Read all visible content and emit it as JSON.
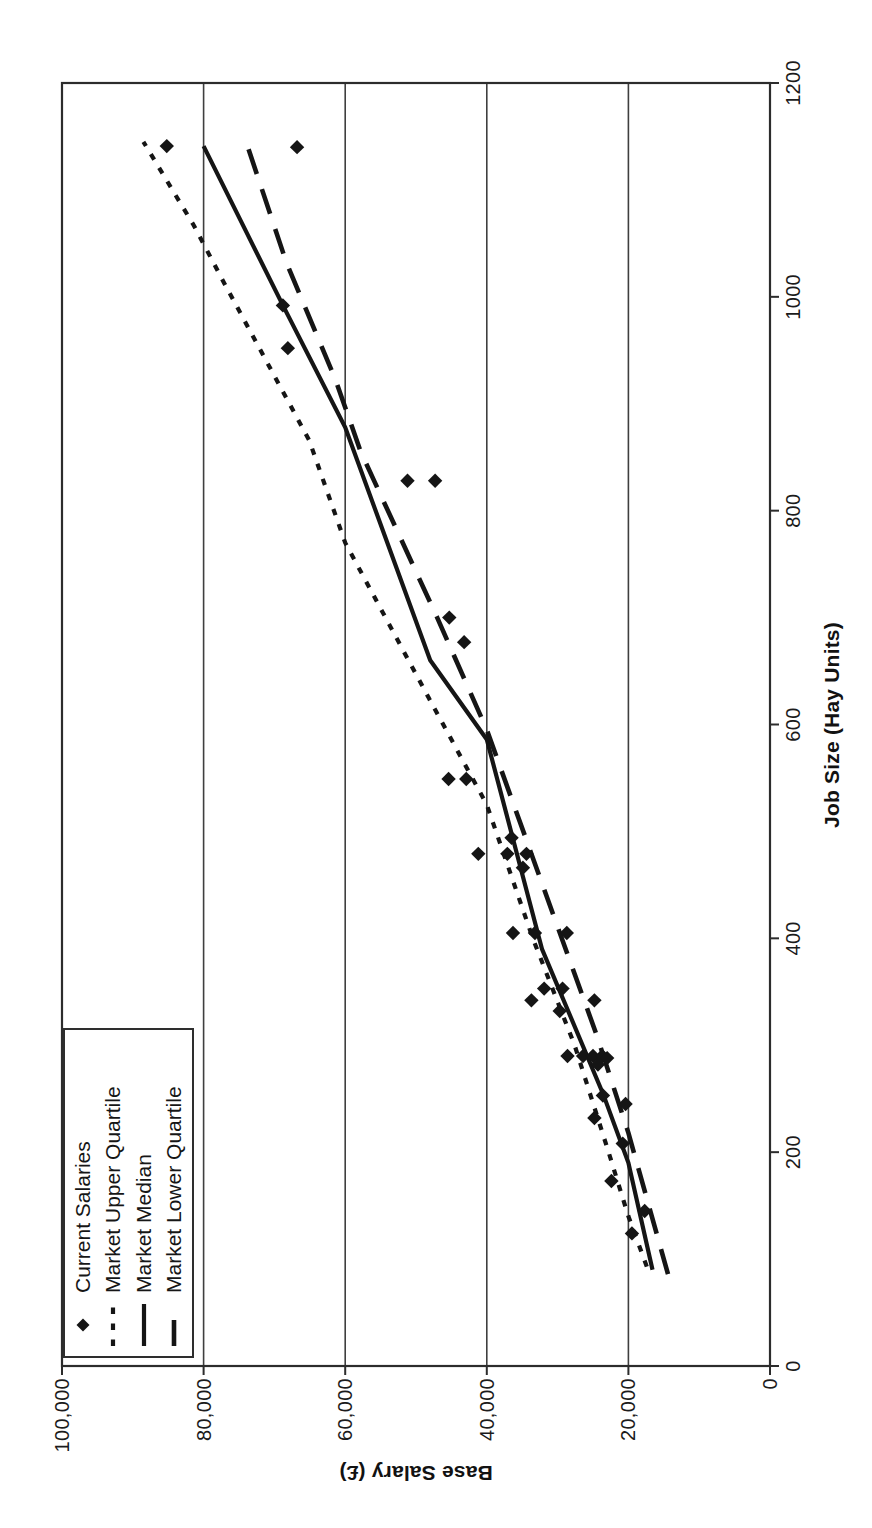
{
  "page": {
    "background": "#ffffff"
  },
  "colors": {
    "ink": "#151515",
    "frame": "#2c2c2c",
    "grid": "#3f3f3f",
    "background": "#ffffff",
    "text": "#1b1b1b"
  },
  "chart_data": {
    "type": "scatter",
    "title": "",
    "xlabel": "Job Size (Hay Units)",
    "ylabel": "Base Salary (£)",
    "xlim": [
      0,
      1200
    ],
    "ylim": [
      0,
      100000
    ],
    "x_ticks": [
      0,
      200,
      400,
      600,
      800,
      1000,
      1200
    ],
    "x_tick_labels": [
      "0",
      "200",
      "400",
      "600",
      "800",
      "1000",
      "1200"
    ],
    "y_ticks": [
      0,
      20000,
      40000,
      60000,
      80000,
      100000
    ],
    "y_tick_labels": [
      "0",
      "20,000",
      "40,000",
      "60,000",
      "80,000",
      "100,000"
    ],
    "grid": "horizontal-only",
    "legend_position": "top-left-inside",
    "orientation": "rotated-90-ccw-on-page",
    "scatter": {
      "name": "Current Salaries",
      "marker": "diamond",
      "points": [
        [
          1141,
          85200
        ],
        [
          1140,
          66800
        ],
        [
          992,
          68800
        ],
        [
          952,
          68100
        ],
        [
          828,
          51200
        ],
        [
          828,
          47300
        ],
        [
          700,
          45300
        ],
        [
          677,
          43200
        ],
        [
          549,
          45400
        ],
        [
          549,
          42900
        ],
        [
          494,
          36500
        ],
        [
          479,
          41200
        ],
        [
          479,
          37100
        ],
        [
          479,
          34400
        ],
        [
          466,
          34900
        ],
        [
          405,
          36300
        ],
        [
          405,
          33200
        ],
        [
          405,
          28700
        ],
        [
          353,
          31900
        ],
        [
          353,
          29300
        ],
        [
          342,
          33700
        ],
        [
          342,
          24800
        ],
        [
          332,
          29700
        ],
        [
          290,
          28600
        ],
        [
          290,
          26400
        ],
        [
          290,
          25000
        ],
        [
          290,
          23700
        ],
        [
          288,
          23000
        ],
        [
          282,
          24300
        ],
        [
          253,
          23600
        ],
        [
          245,
          20400
        ],
        [
          232,
          24800
        ],
        [
          208,
          20800
        ],
        [
          173,
          22400
        ],
        [
          145,
          17700
        ],
        [
          124,
          19500
        ]
      ]
    },
    "series": [
      {
        "name": "Market Upper Quartile",
        "style": "dotted",
        "points": [
          [
            93,
            17400
          ],
          [
            140,
            20000
          ],
          [
            200,
            22800
          ],
          [
            300,
            27600
          ],
          [
            400,
            33500
          ],
          [
            525,
            40000
          ],
          [
            625,
            48200
          ],
          [
            770,
            60000
          ],
          [
            866,
            65100
          ],
          [
            1013,
            77100
          ],
          [
            1067,
            81400
          ],
          [
            1145,
            88500
          ]
        ]
      },
      {
        "name": "Market Median",
        "style": "solid",
        "points": [
          [
            90,
            16600
          ],
          [
            190,
            20000
          ],
          [
            255,
            23600
          ],
          [
            390,
            32200
          ],
          [
            586,
            40000
          ],
          [
            660,
            48000
          ],
          [
            878,
            60000
          ],
          [
            992,
            68800
          ],
          [
            1141,
            80000
          ]
        ]
      },
      {
        "name": "Market Lower Quartile",
        "style": "longdash",
        "points": [
          [
            86,
            14400
          ],
          [
            218,
            20000
          ],
          [
            310,
            24500
          ],
          [
            420,
            30500
          ],
          [
            595,
            40000
          ],
          [
            700,
            47000
          ],
          [
            855,
            57800
          ],
          [
            923,
            61400
          ],
          [
            1032,
            68300
          ],
          [
            1141,
            73800
          ]
        ]
      }
    ]
  }
}
